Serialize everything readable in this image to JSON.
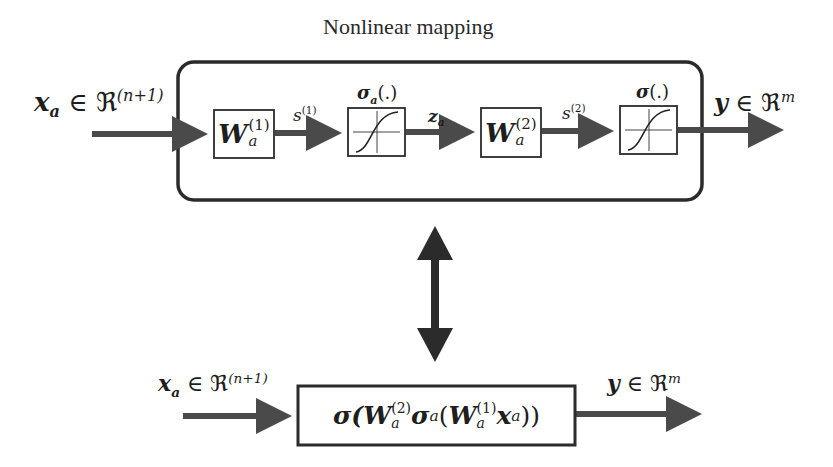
{
  "title": "Nonlinear mapping",
  "top_diagram": {
    "input_label": {
      "var": "x",
      "sub": "a",
      "member": "∈",
      "set": "ℜ",
      "sup": "(n+1)"
    },
    "blocks": [
      {
        "id": "W1",
        "type": "weight",
        "symbol": "W",
        "sub": "a",
        "sup": "(1)"
      },
      {
        "id": "sigma_a",
        "type": "activation",
        "label": "σ",
        "label_sub": "a",
        "label_suffix": "(.)",
        "icon": "sigmoid-icon"
      },
      {
        "id": "W2",
        "type": "weight",
        "symbol": "W",
        "sub": "a",
        "sup": "(2)"
      },
      {
        "id": "sigma",
        "type": "activation",
        "label": "σ",
        "label_sub": "",
        "label_suffix": "(.)",
        "icon": "sigmoid-icon"
      }
    ],
    "signals": [
      {
        "from": "W1",
        "to": "sigma_a",
        "var": "s",
        "sup": "(1)"
      },
      {
        "from": "sigma_a",
        "to": "W2",
        "var": "z",
        "sub": "a"
      },
      {
        "from": "W2",
        "to": "sigma",
        "var": "s",
        "sup": "(2)"
      }
    ],
    "output_label": {
      "var": "y",
      "member": "∈",
      "set": "ℜ",
      "sup": "m"
    }
  },
  "equivalence_arrow": {
    "icon": "double-arrow-vertical-icon"
  },
  "bottom_diagram": {
    "input_label": {
      "var": "x",
      "sub": "a",
      "member": "∈",
      "set": "ℜ",
      "sup": "(n+1)"
    },
    "expression": {
      "outer": "σ(",
      "w2": "W",
      "w2_sub": "a",
      "w2_sup": "(2)",
      "inner_act": "σ",
      "inner_act_sub": "a",
      "open": "(",
      "w1": "W",
      "w1_sub": "a",
      "w1_sup": "(1)",
      "x": "x",
      "x_sub": "a",
      "close": "))"
    },
    "output_label": {
      "var": "y",
      "member": "∈",
      "set": "ℜ",
      "sup": "m"
    }
  },
  "colors": {
    "stroke": "#2b2b2b",
    "arrow": "#4a4a4a",
    "background": "#ffffff"
  }
}
